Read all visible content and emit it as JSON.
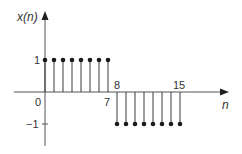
{
  "chart_data": {
    "type": "stem",
    "title": "",
    "xlabel": "n",
    "ylabel": "x(n)",
    "x": [
      0,
      1,
      2,
      3,
      4,
      5,
      6,
      7,
      8,
      9,
      10,
      11,
      12,
      13,
      14,
      15
    ],
    "values": [
      1,
      1,
      1,
      1,
      1,
      1,
      1,
      1,
      -1,
      -1,
      -1,
      -1,
      -1,
      -1,
      -1,
      -1
    ],
    "x_tick_labels": [
      "0",
      "7",
      "8",
      "15"
    ],
    "y_tick_labels": [
      "1",
      "-1"
    ],
    "ylim": [
      -1.6,
      1.9
    ],
    "grid": false,
    "legend": null
  },
  "labels": {
    "ylabel": "x(n)",
    "xlabel": "n",
    "origin": "0",
    "tick_7": "7",
    "tick_8": "8",
    "tick_15": "15",
    "y_pos": "1",
    "y_neg": "−1"
  },
  "colors": {
    "axis": "#4a4a4a",
    "stem": "#3a3a3a",
    "marker": "#1a1a1a",
    "text": "#333333"
  }
}
